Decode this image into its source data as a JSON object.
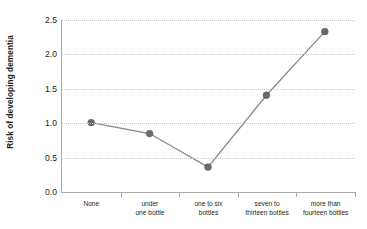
{
  "chart_data": {
    "type": "line",
    "title": "",
    "xlabel": "",
    "ylabel": "Risk of developing dementia",
    "categories": [
      "None",
      "under\none bottle",
      "one to six\nbottles",
      "seven to\nthirteen bottles",
      "more than\nfourteen bottles"
    ],
    "category_lines": [
      [
        "None"
      ],
      [
        "under",
        "one bottle"
      ],
      [
        "one to six",
        "bottles"
      ],
      [
        "seven to",
        "thirteen bottles"
      ],
      [
        "more than",
        "fourteen bottles"
      ]
    ],
    "values": [
      1.0,
      0.84,
      0.35,
      1.4,
      2.33
    ],
    "ylim": [
      0.0,
      2.5
    ],
    "yticks": [
      0.0,
      0.5,
      1.0,
      1.5,
      2.0,
      2.5
    ],
    "ytick_labels": [
      "0.0",
      "0.5",
      "1.0",
      "1.5",
      "2.0",
      "2.5"
    ],
    "grid": true,
    "grid_axis": "y",
    "grid_style": "dotted",
    "legend": false,
    "legend_position": "none",
    "marker": "circle",
    "colors": {
      "line": "#8a8a8a",
      "marker": "#6b6b6b",
      "grid": "#c9c9c9",
      "axis": "#aaaaaa",
      "text": "#231f20",
      "background": "#ffffff"
    }
  }
}
